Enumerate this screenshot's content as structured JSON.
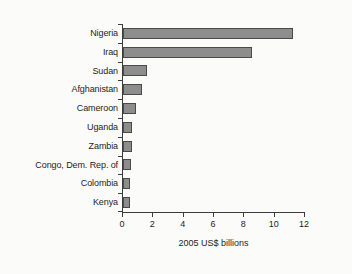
{
  "chart_data": {
    "type": "bar",
    "orientation": "horizontal",
    "title": "",
    "subtitle": "",
    "xlabel": "2005 US$ billions",
    "ylabel": "",
    "categories": [
      "Nigeria",
      "Iraq",
      "Sudan",
      "Afghanistan",
      "Cameroon",
      "Uganda",
      "Zambia",
      "Congo, Dem. Rep. of",
      "Colombia",
      "Kenya"
    ],
    "values": [
      11.2,
      8.5,
      1.6,
      1.25,
      0.85,
      0.6,
      0.58,
      0.5,
      0.48,
      0.45
    ],
    "xlim": [
      0,
      12
    ],
    "xticks": [
      0,
      2,
      4,
      6,
      8,
      10,
      12
    ],
    "xtick_labels": [
      "0",
      "2",
      "4",
      "6",
      "8",
      "10",
      "12"
    ],
    "grid": false,
    "legend": false,
    "legend_position": "none",
    "bar_fill_color": "#8d8d8d",
    "bar_border_color": "#4a4a4a",
    "axis_color": "#3c3c3b",
    "text_color": "#1d1d1b",
    "background_color": "#fbfbfa"
  }
}
